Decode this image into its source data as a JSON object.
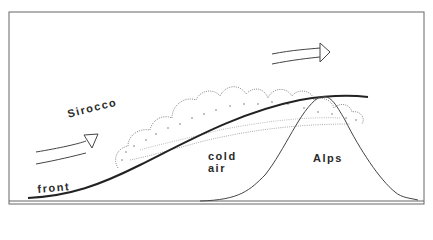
{
  "diagram": {
    "labels": {
      "sirocco": "Sirocco",
      "front": "front",
      "cold": "cold",
      "air": "air",
      "alps": "Alps"
    },
    "colors": {
      "line": "#333333",
      "frame": "#555555",
      "background": "#ffffff"
    }
  }
}
